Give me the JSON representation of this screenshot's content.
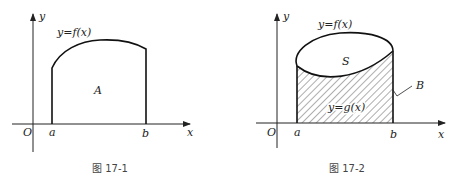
{
  "figures": [
    {
      "caption": "图 17-1",
      "labels": {
        "y_axis": "y",
        "x_axis": "x",
        "origin": "O",
        "a": "a",
        "b": "b",
        "curve": "y=f(x)",
        "region": "A"
      }
    },
    {
      "caption": "图 17-2",
      "labels": {
        "y_axis": "y",
        "x_axis": "x",
        "origin": "O",
        "a": "a",
        "b": "b",
        "upper_curve": "y=f(x)",
        "lower_curve": "y=g(x)",
        "top_region": "S",
        "hatched_region": "B"
      }
    }
  ]
}
